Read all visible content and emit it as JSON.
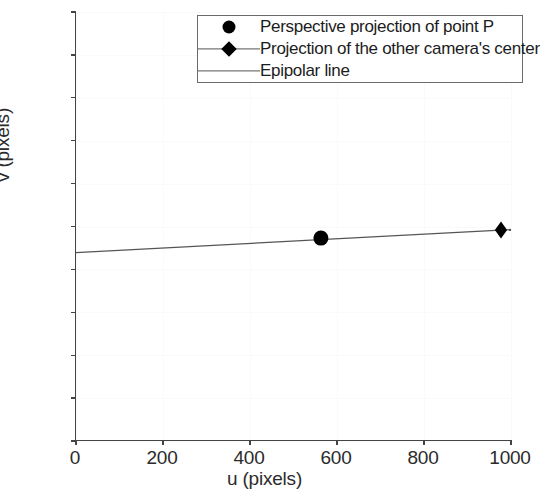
{
  "chart_data": {
    "type": "scatter",
    "title": "",
    "xlabel": "u (pixels)",
    "ylabel": "v (pixels)",
    "xlim": [
      0,
      1000
    ],
    "ylim": [
      1000,
      0
    ],
    "y_inverted": true,
    "grid": true,
    "xticks": [
      0,
      200,
      400,
      600,
      800,
      1000
    ],
    "xticklabels": [
      "0",
      "200",
      "400",
      "600",
      "800",
      "1000"
    ],
    "yticks": [
      0,
      100,
      200,
      300,
      400,
      500,
      600,
      700,
      800,
      900,
      1000
    ],
    "yticklabels": [
      "0",
      "100",
      "200",
      "300",
      "400",
      "500",
      "600",
      "700",
      "800",
      "900",
      "1000"
    ],
    "legend_position": "upper right",
    "series": [
      {
        "name": "Perspective projection of point P",
        "type": "scatter",
        "marker": "circle",
        "color": "#000000",
        "points": [
          {
            "x": 563,
            "y": 527
          }
        ]
      },
      {
        "name": "Projection of the other camera's center",
        "type": "scatter",
        "marker": "diamond",
        "color": "#000000",
        "points": [
          {
            "x": 977,
            "y": 508
          }
        ]
      },
      {
        "name": "Epipolar line",
        "type": "line",
        "color": "#555555",
        "points": [
          {
            "x": 0,
            "y": 561
          },
          {
            "x": 1000,
            "y": 507
          }
        ]
      }
    ]
  },
  "legend": {
    "items": [
      {
        "label": "Perspective projection of point P",
        "symbol": "circle-marker"
      },
      {
        "label": "Projection of the other camera's center",
        "symbol": "diamond-line-marker"
      },
      {
        "label": "Epipolar line",
        "symbol": "line"
      }
    ]
  },
  "axes": {
    "x_title": "u (pixels)",
    "y_title": "v (pixels)",
    "x_ticks": [
      "0",
      "200",
      "400",
      "600",
      "800",
      "1000"
    ],
    "y_ticks": [
      "0",
      "100",
      "200",
      "300",
      "400",
      "500",
      "600",
      "700",
      "800",
      "900",
      "1000"
    ]
  },
  "colors": {
    "axis": "#444444",
    "marker": "#000000",
    "line": "#555555",
    "grid": "#fafafa",
    "background": "#ffffff"
  }
}
